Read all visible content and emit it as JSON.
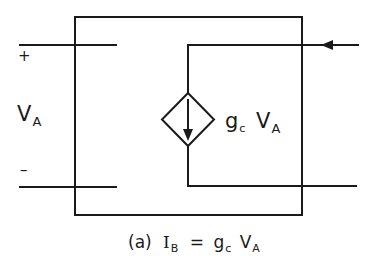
{
  "diagram": {
    "type": "circuit",
    "colors": {
      "line": "#1a1a1a",
      "background": "#ffffff"
    },
    "port_a": {
      "plus_label": "+",
      "minus_label": "–",
      "voltage_main": "V",
      "voltage_sub": "A"
    },
    "dependent_source": {
      "shape": "diamond",
      "kind": "voltage-controlled current source",
      "arrow_direction": "down",
      "gain_main": "g",
      "gain_sub": "c",
      "controlling_main": "V",
      "controlling_sub": "A"
    },
    "port_b": {
      "current_arrow_direction": "left"
    },
    "caption": {
      "prefix": "(a)",
      "lhs_main": "I",
      "lhs_sub": "B",
      "equals": "=",
      "rhs_gain_main": "g",
      "rhs_gain_sub": "c",
      "rhs_var_main": "V",
      "rhs_var_sub": "A"
    }
  }
}
